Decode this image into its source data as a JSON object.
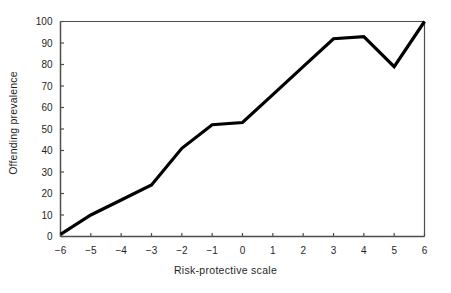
{
  "chart_data": {
    "type": "line",
    "title": "",
    "xlabel": "Risk-protective scale",
    "ylabel": "Offending prevalence",
    "x": [
      -6,
      -5,
      -4,
      -3,
      -2,
      -1,
      0,
      1,
      2,
      3,
      4,
      5,
      6
    ],
    "values": [
      1,
      10,
      17,
      24,
      41,
      52,
      53,
      66,
      79,
      92,
      93,
      79,
      100
    ],
    "series": [
      {
        "name": "Offending prevalence",
        "values": [
          1,
          10,
          17,
          24,
          41,
          52,
          53,
          66,
          79,
          92,
          93,
          79,
          100
        ]
      }
    ],
    "xlim": [
      -6,
      6
    ],
    "ylim": [
      0,
      100
    ],
    "xticks": [
      "−6",
      "−5",
      "−4",
      "−3",
      "−2",
      "−1",
      "0",
      "1",
      "2",
      "3",
      "4",
      "5",
      "6"
    ],
    "yticks": [
      "0",
      "10",
      "20",
      "30",
      "40",
      "50",
      "60",
      "70",
      "80",
      "90",
      "100"
    ],
    "grid": false,
    "legend": "none",
    "line_color": "#000000",
    "axis_color": "#4d4d4d"
  }
}
